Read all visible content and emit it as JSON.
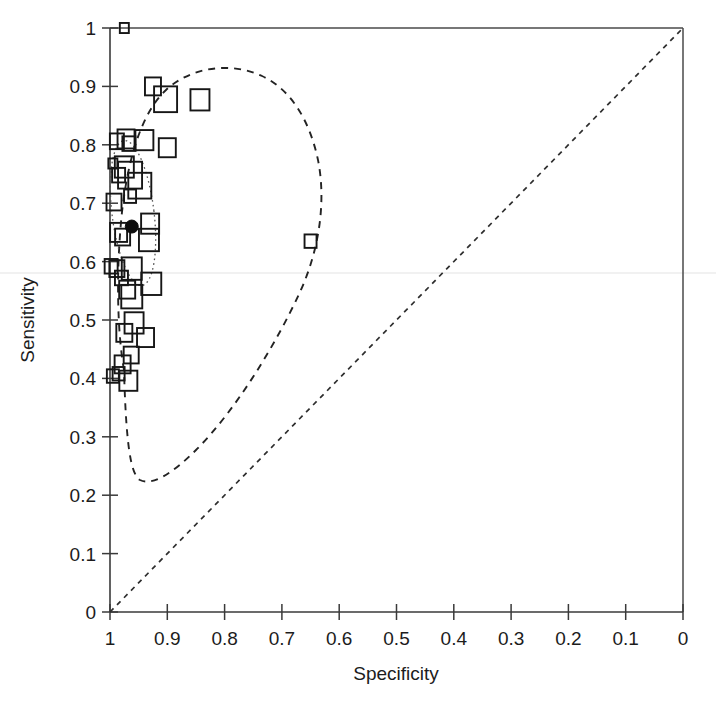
{
  "figure": {
    "kind": "sroc-scatter-plot",
    "background_color": "#ffffff",
    "ink_color": "#1a1a1a"
  },
  "chart_data": {
    "type": "scatter",
    "title": "",
    "subtitle": "",
    "xlabel": "Specificity",
    "ylabel": "Sensitivity",
    "xlim": [
      1,
      0
    ],
    "ylim": [
      0,
      1
    ],
    "x_axis_reversed": true,
    "grid": false,
    "legend": null,
    "legend_position": "none",
    "xticks": [
      "1",
      "0.9",
      "0.8",
      "0.7",
      "0.6",
      "0.5",
      "0.4",
      "0.3",
      "0.2",
      "0.1",
      "0"
    ],
    "xtick_values": [
      1,
      0.9,
      0.8,
      0.7,
      0.6,
      0.5,
      0.4,
      0.3,
      0.2,
      0.1,
      0
    ],
    "yticks": [
      "0",
      "0.1",
      "0.2",
      "0.3",
      "0.4",
      "0.5",
      "0.6",
      "0.7",
      "0.8",
      "0.9",
      "1"
    ],
    "ytick_values": [
      0,
      0.1,
      0.2,
      0.3,
      0.4,
      0.5,
      0.6,
      0.7,
      0.8,
      0.9,
      1
    ],
    "annotations": [
      {
        "name": "chance-diagonal",
        "description": "dashed chance line from (specificity 1, sensitivity 0) to (specificity 0, sensitivity 1)",
        "style": "dashed",
        "from": [
          1,
          0
        ],
        "to": [
          0,
          1
        ]
      },
      {
        "name": "confidence-region",
        "description": "dashed 95% confidence region enclosing the study estimates",
        "style": "dashed"
      },
      {
        "name": "summary-confidence-ellipse",
        "description": "dotted 95% confidence ellipse around the pooled summary point",
        "style": "dotted"
      }
    ],
    "series": [
      {
        "name": "individual studies",
        "marker": "open-square",
        "marker_note": "square size is proportional to study weight",
        "points": [
          {
            "x": 0.975,
            "y": 1.0,
            "size": 9
          },
          {
            "x": 0.995,
            "y": 0.768,
            "size": 9
          },
          {
            "x": 0.988,
            "y": 0.806,
            "size": 14
          },
          {
            "x": 0.972,
            "y": 0.81,
            "size": 17
          },
          {
            "x": 0.967,
            "y": 0.802,
            "size": 13
          },
          {
            "x": 0.94,
            "y": 0.808,
            "size": 18
          },
          {
            "x": 0.9,
            "y": 0.795,
            "size": 17
          },
          {
            "x": 0.975,
            "y": 0.762,
            "size": 19
          },
          {
            "x": 0.985,
            "y": 0.748,
            "size": 13
          },
          {
            "x": 0.965,
            "y": 0.748,
            "size": 24
          },
          {
            "x": 0.948,
            "y": 0.73,
            "size": 23
          },
          {
            "x": 0.993,
            "y": 0.702,
            "size": 15
          },
          {
            "x": 0.965,
            "y": 0.712,
            "size": 12
          },
          {
            "x": 0.925,
            "y": 0.9,
            "size": 16
          },
          {
            "x": 0.903,
            "y": 0.878,
            "size": 23
          },
          {
            "x": 0.843,
            "y": 0.877,
            "size": 19
          },
          {
            "x": 0.93,
            "y": 0.665,
            "size": 18
          },
          {
            "x": 0.932,
            "y": 0.637,
            "size": 20
          },
          {
            "x": 0.65,
            "y": 0.635,
            "size": 12
          },
          {
            "x": 0.985,
            "y": 0.65,
            "size": 17
          },
          {
            "x": 0.978,
            "y": 0.642,
            "size": 15
          },
          {
            "x": 0.998,
            "y": 0.592,
            "size": 13
          },
          {
            "x": 0.988,
            "y": 0.588,
            "size": 15
          },
          {
            "x": 0.962,
            "y": 0.588,
            "size": 20
          },
          {
            "x": 0.98,
            "y": 0.572,
            "size": 13
          },
          {
            "x": 0.928,
            "y": 0.562,
            "size": 20
          },
          {
            "x": 0.97,
            "y": 0.552,
            "size": 16
          },
          {
            "x": 0.962,
            "y": 0.54,
            "size": 21
          },
          {
            "x": 0.958,
            "y": 0.495,
            "size": 19
          },
          {
            "x": 0.975,
            "y": 0.478,
            "size": 16
          },
          {
            "x": 0.938,
            "y": 0.47,
            "size": 17
          },
          {
            "x": 0.963,
            "y": 0.44,
            "size": 15
          },
          {
            "x": 0.978,
            "y": 0.424,
            "size": 16
          },
          {
            "x": 0.985,
            "y": 0.408,
            "size": 12
          },
          {
            "x": 0.995,
            "y": 0.404,
            "size": 12
          },
          {
            "x": 0.968,
            "y": 0.396,
            "size": 18
          }
        ]
      },
      {
        "name": "pooled summary estimate",
        "marker": "filled-circle",
        "points": [
          {
            "x": 0.962,
            "y": 0.66,
            "size": 13
          }
        ]
      }
    ]
  },
  "axes": {
    "x_title": "Specificity",
    "y_title": "Sensitivity"
  }
}
